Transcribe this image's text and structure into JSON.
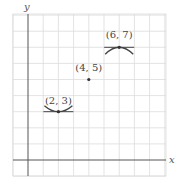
{
  "chart_data": {
    "type": "scatter",
    "title": "",
    "xlabel": "x",
    "ylabel": "y",
    "grid": true,
    "xlim": [
      -1,
      9
    ],
    "ylim": [
      -1,
      9
    ],
    "points": [
      {
        "x": 2,
        "y": 3,
        "label": "(2, 3)",
        "curve": "concave-up"
      },
      {
        "x": 4,
        "y": 5,
        "label": "(4, 5)",
        "curve": "none"
      },
      {
        "x": 6,
        "y": 7,
        "label": "(6, 7)",
        "curve": "concave-down"
      }
    ],
    "annotations": [
      "Horizontal tangent line with concave-up arc at (2, 3)",
      "Isolated point at (4, 5)",
      "Horizontal tangent line with concave-down arc at (6, 7)"
    ]
  },
  "colors": {
    "grid": "#dcdcdc",
    "axis": "#555555",
    "curve": "#444444",
    "point": "#333333"
  }
}
